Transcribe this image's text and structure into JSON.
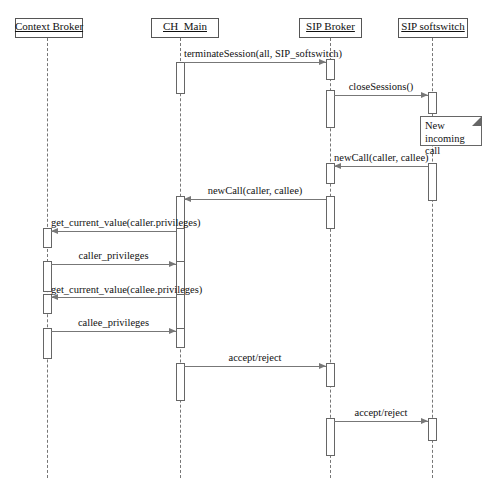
{
  "diagram": {
    "type": "uml-sequence-diagram",
    "title": "",
    "width": 485,
    "height": 490,
    "line_color": "#777777",
    "text_color": "#111111",
    "background": "#ffffff"
  },
  "participants": [
    {
      "id": "context-broker",
      "label": "Context Broker",
      "x": 47,
      "box_left": 15,
      "box_top": 18,
      "box_width": 68,
      "box_height": 20
    },
    {
      "id": "ch-main",
      "label": "CH_Main",
      "x": 180,
      "box_left": 151,
      "box_top": 18,
      "box_width": 68,
      "box_height": 20
    },
    {
      "id": "sip-broker",
      "label": "SIP Broker",
      "x": 330,
      "box_left": 299,
      "box_top": 18,
      "box_width": 63,
      "box_height": 20
    },
    {
      "id": "sip-softswitch",
      "label": "SIP softswitch",
      "x": 432,
      "box_left": 398,
      "box_top": 18,
      "box_width": 70,
      "box_height": 20
    }
  ],
  "notes": [
    {
      "id": "note-new-incoming-call",
      "text": "New incoming call",
      "left": 420,
      "top": 116,
      "width": 62,
      "height": 30
    }
  ],
  "messages": [
    {
      "id": "msg-terminate-session",
      "label": "terminateSession(all, SIP_softswitch)",
      "from": "ch-main",
      "to": "sip-broker",
      "direction": "right",
      "y": 62,
      "label_y": 48
    },
    {
      "id": "msg-close-sessions",
      "label": "closeSessions()",
      "from": "sip-broker",
      "to": "sip-softswitch",
      "direction": "right",
      "y": 95,
      "label_y": 81
    },
    {
      "id": "msg-new-call-1",
      "label": "newCall(caller, callee)",
      "from": "sip-softswitch",
      "to": "sip-broker",
      "direction": "left",
      "y": 166,
      "label_y": 152
    },
    {
      "id": "msg-new-call-2",
      "label": "newCall(caller, callee)",
      "from": "sip-broker",
      "to": "ch-main",
      "direction": "left",
      "y": 199,
      "label_y": 185
    },
    {
      "id": "msg-get-caller-priv",
      "label": "get_current_value(caller.privileges)",
      "from": "ch-main",
      "to": "context-broker",
      "direction": "left",
      "y": 231,
      "label_y": 217
    },
    {
      "id": "msg-caller-privileges",
      "label": "caller_privileges",
      "from": "context-broker",
      "to": "ch-main",
      "direction": "right",
      "y": 264,
      "label_y": 250
    },
    {
      "id": "msg-get-callee-priv",
      "label": "get_current_value(callee.privileges)",
      "from": "ch-main",
      "to": "context-broker",
      "direction": "left",
      "y": 297,
      "label_y": 284
    },
    {
      "id": "msg-callee-privileges",
      "label": "callee_privileges",
      "from": "context-broker",
      "to": "ch-main",
      "direction": "right",
      "y": 331,
      "label_y": 317
    },
    {
      "id": "msg-accept-reject-1",
      "label": "accept/reject",
      "from": "ch-main",
      "to": "sip-broker",
      "direction": "right",
      "y": 366,
      "label_y": 352
    },
    {
      "id": "msg-accept-reject-2",
      "label": "accept/reject",
      "from": "sip-broker",
      "to": "sip-softswitch",
      "direction": "right",
      "y": 421,
      "label_y": 407
    }
  ],
  "activations": [
    {
      "id": "act-ch-main-1",
      "participant": "ch-main",
      "top": 62,
      "height": 32
    },
    {
      "id": "act-sip-broker-1",
      "participant": "sip-broker",
      "top": 59,
      "height": 21
    },
    {
      "id": "act-sip-broker-2",
      "participant": "sip-broker",
      "top": 90,
      "height": 38
    },
    {
      "id": "act-softswitch-1",
      "participant": "sip-softswitch",
      "top": 92,
      "height": 22
    },
    {
      "id": "act-softswitch-2",
      "participant": "sip-softswitch",
      "top": 163,
      "height": 38
    },
    {
      "id": "act-sip-broker-3",
      "participant": "sip-broker",
      "top": 163,
      "height": 21
    },
    {
      "id": "act-sip-broker-4",
      "participant": "sip-broker",
      "top": 196,
      "height": 33
    },
    {
      "id": "act-ch-main-2",
      "participant": "ch-main",
      "top": 196,
      "height": 38
    },
    {
      "id": "act-ctx-broker-1",
      "participant": "context-broker",
      "top": 228,
      "height": 20
    },
    {
      "id": "act-ch-main-3",
      "participant": "ch-main",
      "top": 228,
      "height": 38
    },
    {
      "id": "act-ctx-broker-2",
      "participant": "context-broker",
      "top": 261,
      "height": 31
    },
    {
      "id": "act-ch-main-4",
      "participant": "ch-main",
      "top": 261,
      "height": 39
    },
    {
      "id": "act-ctx-broker-3",
      "participant": "context-broker",
      "top": 294,
      "height": 20
    },
    {
      "id": "act-ch-main-5",
      "participant": "ch-main",
      "top": 294,
      "height": 39
    },
    {
      "id": "act-ctx-broker-4",
      "participant": "context-broker",
      "top": 328,
      "height": 31
    },
    {
      "id": "act-ch-main-6",
      "participant": "ch-main",
      "top": 328,
      "height": 20
    },
    {
      "id": "act-ch-main-7",
      "participant": "ch-main",
      "top": 363,
      "height": 38
    },
    {
      "id": "act-sip-broker-5",
      "participant": "sip-broker",
      "top": 363,
      "height": 24
    },
    {
      "id": "act-sip-broker-6",
      "participant": "sip-broker",
      "top": 418,
      "height": 38
    },
    {
      "id": "act-softswitch-3",
      "participant": "sip-softswitch",
      "top": 418,
      "height": 23
    }
  ],
  "lifelines": [
    {
      "participant": "context-broker",
      "top": 38,
      "bottom": 478
    },
    {
      "participant": "ch-main",
      "top": 38,
      "bottom": 478
    },
    {
      "participant": "sip-broker",
      "top": 38,
      "bottom": 478
    },
    {
      "participant": "sip-softswitch",
      "top": 38,
      "bottom": 478
    }
  ]
}
